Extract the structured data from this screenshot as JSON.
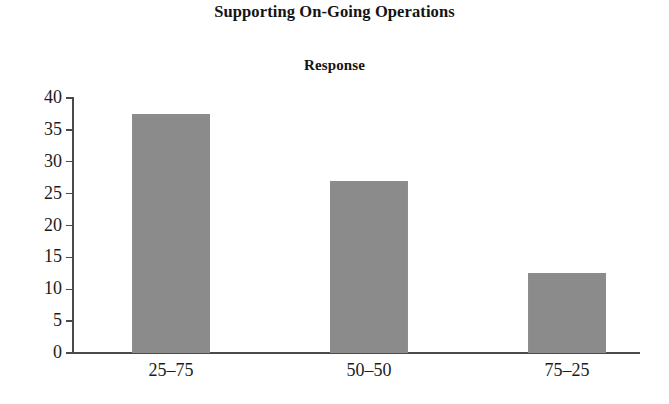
{
  "chart_data": {
    "type": "bar",
    "title": "Supporting On-Going Operations",
    "subtitle": "Response",
    "xlabel": "",
    "ylabel": "",
    "categories": [
      "25–75",
      "50–50",
      "75–25"
    ],
    "values": [
      37.5,
      27,
      12.5
    ],
    "ylim": [
      0,
      40
    ],
    "yticks": [
      0,
      5,
      10,
      15,
      20,
      25,
      30,
      35,
      40
    ],
    "ytick_labels": [
      "0",
      "5",
      "10",
      "15",
      "20",
      "25",
      "30",
      "35",
      "40"
    ],
    "grid": false,
    "legend": null,
    "series": [
      {
        "name": "Response",
        "values": [
          37.5,
          27,
          12.5
        ]
      }
    ],
    "bar_color": "#8b8b8b",
    "axis_color": "#4a4a4a",
    "background": "#ffffff"
  }
}
